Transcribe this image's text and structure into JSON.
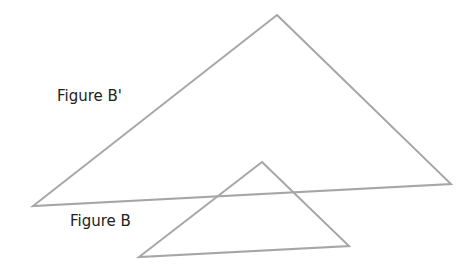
{
  "diagram": {
    "stroke_color": "#a6a6a6",
    "stroke_width": 2,
    "text_color": "#222222",
    "figures": [
      {
        "id": "figure-b-prime",
        "label": "Figure B'",
        "vertices": [
          [
            277,
            15
          ],
          [
            451,
            184
          ],
          [
            33,
            206
          ]
        ]
      },
      {
        "id": "figure-b",
        "label": "Figure B",
        "vertices": [
          [
            262,
            162
          ],
          [
            349,
            246
          ],
          [
            139,
            257
          ]
        ]
      }
    ]
  }
}
